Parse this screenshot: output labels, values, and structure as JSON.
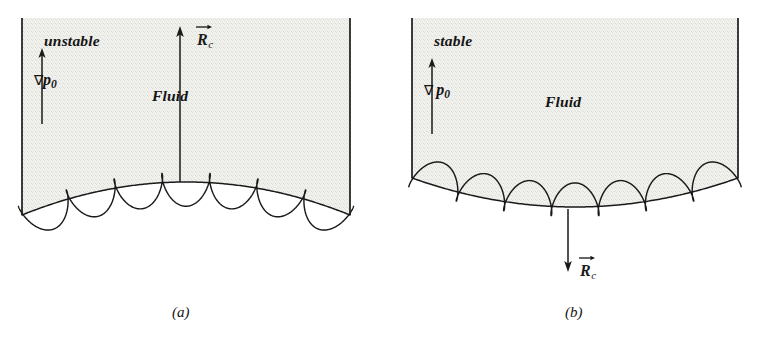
{
  "figure": {
    "type": "scientific-diagram",
    "background_color": "#ffffff",
    "ink_color": "#1a1a1a",
    "fluid_fill_color": "#f2f2ef",
    "stipple_color": "#9a9a92"
  },
  "panels": [
    {
      "id": "a",
      "caption": "(a)",
      "caption_x": 172,
      "caption_y": 305,
      "stability_label": "unstable",
      "stability_label_x": 44,
      "stability_label_y": 33,
      "fluid_label": "Fluid",
      "fluid_label_x": 152,
      "fluid_label_y": 88,
      "gradient_label": {
        "nabla": "∇",
        "symbol": "p",
        "subscript": "0",
        "x": 34,
        "y": 72
      },
      "curvature_vector": {
        "symbol": "R",
        "subscript": "c",
        "direction": "up",
        "label_x": 197,
        "label_y": 31,
        "arrow_x": 180,
        "arrow_tail_y": 182,
        "arrow_head_y": 26
      },
      "geometry": {
        "left_wall_x": 22,
        "right_wall_x": 350,
        "top_y": 18,
        "interface_edge_y": 215,
        "interface_apex_y": 182,
        "curvature": "convex-up",
        "loops": 7,
        "loop_direction": "down"
      }
    },
    {
      "id": "b",
      "caption": "(b)",
      "caption_x": 565,
      "caption_y": 305,
      "stability_label": "stable",
      "stability_label_x": 434,
      "stability_label_y": 33,
      "fluid_label": "Fluid",
      "fluid_label_x": 545,
      "fluid_label_y": 94,
      "gradient_label": {
        "nabla": "∇",
        "symbol": "p",
        "subscript": "0",
        "x": 424,
        "y": 82
      },
      "curvature_vector": {
        "symbol": "R",
        "subscript": "c",
        "direction": "down",
        "label_x": 580,
        "label_y": 262,
        "arrow_x": 568,
        "arrow_tail_y": 209,
        "arrow_head_y": 272
      },
      "geometry": {
        "left_wall_x": 412,
        "right_wall_x": 738,
        "top_y": 18,
        "interface_edge_y": 178,
        "interface_apex_y": 207,
        "curvature": "concave-up",
        "loops": 7,
        "loop_direction": "up"
      }
    }
  ]
}
